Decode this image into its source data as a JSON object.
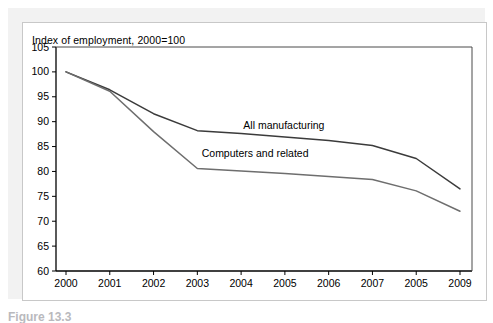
{
  "figure": {
    "caption": "Figure 13.3"
  },
  "chart_data": {
    "type": "line",
    "title": "Index of employment, 2000=100",
    "xlabel": "",
    "ylabel": "",
    "grid": false,
    "legend_position": "inline-annotations",
    "categories": [
      "2000",
      "2001",
      "2002",
      "2003",
      "2004",
      "2005",
      "2006",
      "2007",
      "2005",
      "2009"
    ],
    "x_tick_labels": [
      "2000",
      "2001",
      "2002",
      "2003",
      "2004",
      "2005",
      "2006",
      "2007",
      "2005",
      "2009"
    ],
    "y_tick_labels": [
      "105",
      "100",
      "95",
      "90",
      "85",
      "80",
      "75",
      "70",
      "65",
      "60"
    ],
    "ylim": [
      60,
      105
    ],
    "y_tick_step": 5,
    "series": [
      {
        "name": "All manufacturing",
        "color": "#3b3b3b",
        "values": [
          100.0,
          96.4,
          91.6,
          88.2,
          87.6,
          86.9,
          86.2,
          85.2,
          82.6,
          76.5
        ]
      },
      {
        "name": "Computers and related",
        "color": "#6e6e6e",
        "values": [
          100.0,
          96.1,
          88.0,
          80.6,
          80.1,
          79.6,
          79.0,
          78.4,
          76.1,
          72.0
        ]
      }
    ],
    "annotations": [
      {
        "text": "All manufacturing",
        "x_value": 2004.05,
        "y_value": 88.6
      },
      {
        "text": "Computers and related",
        "x_value": 2003.1,
        "y_value": 83.0
      }
    ]
  }
}
